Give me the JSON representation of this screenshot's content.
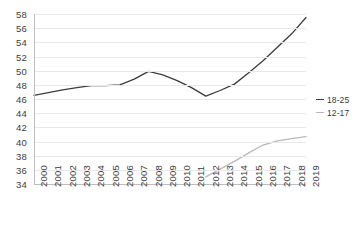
{
  "chart_data": {
    "type": "line",
    "title": "",
    "subtitle": "",
    "xlabel": "",
    "ylabel": "",
    "x": [
      2000,
      2001,
      2002,
      2003,
      2004,
      2005,
      2006,
      2007,
      2008,
      2009,
      2010,
      2011,
      2012,
      2013,
      2014,
      2015,
      2016,
      2017,
      2018,
      2019
    ],
    "xticklabels": [
      "2000",
      "2001",
      "2002",
      "2003",
      "2004",
      "2005",
      "2006",
      "2007",
      "2008",
      "2009",
      "2010",
      "2011",
      "2012",
      "2013",
      "2014",
      "2015",
      "2016",
      "2017",
      "2018",
      "2019"
    ],
    "yticklabels": [
      "34",
      "36",
      "38",
      "40",
      "42",
      "44",
      "46",
      "48",
      "50",
      "52",
      "54",
      "56",
      "58"
    ],
    "yticks": [
      34,
      36,
      38,
      40,
      42,
      44,
      46,
      48,
      50,
      52,
      54,
      56,
      58
    ],
    "ylim": [
      34,
      58
    ],
    "xlim": [
      2000,
      2019
    ],
    "grid": "horizontal",
    "legend_position": "right",
    "series": [
      {
        "name": "18-25",
        "color": "#3c3c3c",
        "x": [
          2000,
          2001,
          2002,
          2003,
          2004,
          2005,
          2006,
          2007,
          2008,
          2009,
          2010,
          2011,
          2012,
          2013,
          2014,
          2015,
          2016,
          2017,
          2018,
          2019
        ],
        "values": [
          46.5,
          46.9,
          47.3,
          47.6,
          47.9,
          47.9,
          48.0,
          48.8,
          49.9,
          49.4,
          48.6,
          47.6,
          46.4,
          47.2,
          48.1,
          49.7,
          51.4,
          53.3,
          55.2,
          57.5
        ]
      },
      {
        "name": "12-17",
        "color": "#b9b9b9",
        "x": [
          2012,
          2013,
          2014,
          2015,
          2016,
          2017,
          2018,
          2019
        ],
        "values": [
          35.0,
          36.1,
          37.2,
          38.4,
          39.5,
          40.1,
          40.4,
          40.7
        ]
      }
    ]
  },
  "legend": {
    "entries": [
      {
        "label": "18-25",
        "color": "#3c3c3c"
      },
      {
        "label": "12-17",
        "color": "#b9b9b9"
      }
    ]
  },
  "axes": {
    "y_axis_color": "#bdbdbd",
    "x_axis_color": "#bdbdbd",
    "gridline_color": "#e8e8e8"
  }
}
